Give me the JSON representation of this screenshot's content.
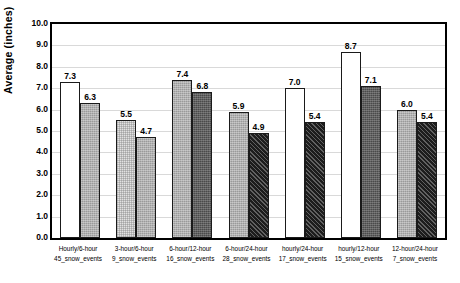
{
  "chart_data": {
    "type": "bar",
    "title": "",
    "xlabel": "",
    "ylabel": "Average (inches)",
    "ylim": [
      0,
      10
    ],
    "ytick_step": 1.0,
    "grid": true,
    "legend": "none",
    "ytick_labels": [
      "10.0",
      "9.0",
      "8.0",
      "7.0",
      "6.0",
      "5.0",
      "4.0",
      "3.0",
      "2.0",
      "1.0",
      "0.0"
    ],
    "categories": [
      {
        "line1": "Hourly/6-hour",
        "line2": "45_snow_events"
      },
      {
        "line1": "3-hour/6-hour",
        "line2": "9_snow_events"
      },
      {
        "line1": "6-hour/12-hour",
        "line2": "16_snow_events"
      },
      {
        "line1": "6-hour/24-hour",
        "line2": "28_snow_events"
      },
      {
        "line1": "hourly/24-hour",
        "line2": "17_snow_events"
      },
      {
        "line1": "hourly/12-hour",
        "line2": "15_snow_events"
      },
      {
        "line1": "12-hour/24-hour",
        "line2": "7_snow_events"
      }
    ],
    "bars": [
      {
        "group": 0,
        "index": 0,
        "value": 7.3,
        "label": "7.3",
        "fill": "white"
      },
      {
        "group": 0,
        "index": 1,
        "value": 6.3,
        "label": "6.3",
        "fill": "medgray"
      },
      {
        "group": 1,
        "index": 0,
        "value": 5.5,
        "label": "5.5",
        "fill": "lightgray"
      },
      {
        "group": 1,
        "index": 1,
        "value": 4.7,
        "label": "4.7",
        "fill": "medgray"
      },
      {
        "group": 2,
        "index": 0,
        "value": 7.4,
        "label": "7.4",
        "fill": "medgray"
      },
      {
        "group": 2,
        "index": 1,
        "value": 6.8,
        "label": "6.8",
        "fill": "darkgray"
      },
      {
        "group": 3,
        "index": 0,
        "value": 5.9,
        "label": "5.9",
        "fill": "medgray"
      },
      {
        "group": 3,
        "index": 1,
        "value": 4.9,
        "label": "4.9",
        "fill": "hatch"
      },
      {
        "group": 4,
        "index": 0,
        "value": 7.0,
        "label": "7.0",
        "fill": "white"
      },
      {
        "group": 4,
        "index": 1,
        "value": 5.4,
        "label": "5.4",
        "fill": "hatch"
      },
      {
        "group": 5,
        "index": 0,
        "value": 8.7,
        "label": "8.7",
        "fill": "white"
      },
      {
        "group": 5,
        "index": 1,
        "value": 7.1,
        "label": "7.1",
        "fill": "darkgray"
      },
      {
        "group": 6,
        "index": 0,
        "value": 6.0,
        "label": "6.0",
        "fill": "medgray"
      },
      {
        "group": 6,
        "index": 1,
        "value": 5.4,
        "label": "5.4",
        "fill": "hatch"
      }
    ]
  }
}
